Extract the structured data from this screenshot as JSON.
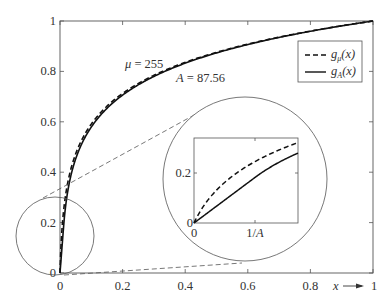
{
  "chart_data": {
    "type": "line",
    "title": "",
    "xlabel": "x",
    "ylabel": "",
    "xlim": [
      0,
      1
    ],
    "ylim": [
      0,
      1
    ],
    "grid": false,
    "legend_position": "upper right",
    "x_ticks": [
      "0",
      "0.2",
      "0.4",
      "0.6",
      "0.8",
      "1"
    ],
    "y_ticks": [
      "0",
      "0.2",
      "0.4",
      "0.6",
      "0.8",
      "1"
    ],
    "series": [
      {
        "name": "g_μ(x)",
        "style": "dashed",
        "formula": "ln(1+μx)/ln(1+μ)",
        "mu": 255,
        "x": [
          0,
          0.01,
          0.02,
          0.05,
          0.1,
          0.2,
          0.3,
          0.4,
          0.5,
          0.6,
          0.7,
          0.8,
          0.9,
          1.0
        ],
        "values": [
          0,
          0.232,
          0.338,
          0.512,
          0.637,
          0.761,
          0.834,
          0.886,
          0.927,
          0.959,
          0.987,
          1.011,
          1.032,
          1.0
        ]
      },
      {
        "name": "g_A(x)",
        "style": "solid",
        "formula": "A-law",
        "A": 87.56,
        "x": [
          0,
          0.01142,
          0.02,
          0.05,
          0.1,
          0.2,
          0.3,
          0.4,
          0.5,
          0.6,
          0.7,
          0.8,
          0.9,
          1.0
        ],
        "values": [
          0,
          0.183,
          0.285,
          0.453,
          0.58,
          0.706,
          0.78,
          0.833,
          0.874,
          0.907,
          0.935,
          0.959,
          0.981,
          1.0
        ]
      }
    ],
    "annotations": [
      {
        "text": "μ = 255"
      },
      {
        "text": "A = 87.56"
      }
    ],
    "inset": {
      "description": "zoomed view of region near origin",
      "x_ticks": [
        "0",
        "1/A"
      ],
      "y_ticks": [
        "0",
        "0.2"
      ],
      "xlim_label": "0 to ~1.7/A",
      "ylim": [
        0,
        0.34
      ]
    }
  },
  "labels": {
    "legend_mu": "g",
    "legend_mu_sub": "μ",
    "legend_mu_arg": "(x)",
    "legend_a": "g",
    "legend_a_sub": "A",
    "legend_a_arg": "(x)",
    "annot_mu": "μ = 255",
    "annot_a": "A = 87.56",
    "xlabel": "x",
    "x_ticks": [
      "0",
      "0.2",
      "0.4",
      "0.6",
      "0.8",
      "1"
    ],
    "y_ticks": [
      "0",
      "0.2",
      "0.4",
      "0.6",
      "0.8",
      "1"
    ],
    "inset_x_ticks": [
      "0",
      "1/A"
    ],
    "inset_y_ticks": [
      "0",
      "0.2"
    ]
  }
}
